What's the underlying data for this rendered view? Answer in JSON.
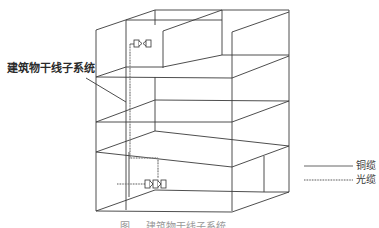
{
  "diagram": {
    "title_label": "建筑物干线子系统",
    "legend": {
      "copper_label": "铜缆",
      "fiber_label": "光缆"
    },
    "caption": "图 ... 建筑物干线子系统",
    "elements": {
      "building": "multi-floor-building-cutaway",
      "floors": 4,
      "upper_connector": "patch-panel-icon",
      "lower_connector": "patch-panel-icon",
      "backbone_cable": "fiber-dotted-line"
    },
    "colors": {
      "line": "#3a3a3a",
      "fiber": "#777777",
      "background": "#ffffff"
    }
  }
}
